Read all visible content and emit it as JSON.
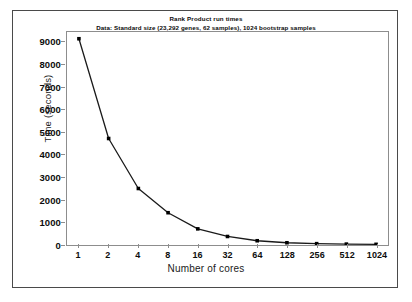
{
  "chart_data": {
    "type": "line",
    "title": "Rank Product run times",
    "subtitle": "Data: Standard size (23,292 genes, 62 samples), 1024 bootstrap samples",
    "xlabel": "Number of cores",
    "ylabel": "Time (seconds)",
    "xscale": "log2",
    "grid": false,
    "legend": "none",
    "marker": "filled-square",
    "line_color": "#1a1a1a",
    "marker_color": "#000000",
    "categories": [
      1,
      2,
      4,
      8,
      16,
      32,
      64,
      128,
      256,
      512,
      1024
    ],
    "xtick_labels": [
      "1",
      "2",
      "4",
      "8",
      "16",
      "32",
      "64",
      "128",
      "256",
      "512",
      "1024"
    ],
    "values": [
      9200,
      4750,
      2520,
      1440,
      720,
      380,
      190,
      100,
      60,
      40,
      30
    ],
    "ylim": [
      0,
      9500
    ],
    "yticks": [
      0,
      1000,
      2000,
      3000,
      4000,
      5000,
      6000,
      7000,
      8000,
      9000
    ],
    "ytick_labels": [
      "0",
      "1000",
      "2000",
      "3000",
      "4000",
      "5000",
      "6000",
      "7000",
      "8000",
      "9000"
    ],
    "series": [
      {
        "name": "Rank Product run time",
        "values": [
          9200,
          4750,
          2520,
          1440,
          720,
          380,
          190,
          100,
          60,
          40,
          30
        ]
      }
    ]
  }
}
